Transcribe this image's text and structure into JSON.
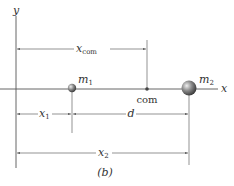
{
  "figure": {
    "caption": "(b)",
    "axes": {
      "x_label": "x",
      "y_label": "y"
    },
    "particles": [
      {
        "name": "m",
        "subscript": "1",
        "label": "m₁",
        "position_label": "x₁",
        "size": "small"
      },
      {
        "name": "m",
        "subscript": "2",
        "label": "m₂",
        "position_label": "x₂",
        "size": "large"
      }
    ],
    "center_of_mass": {
      "point_label": "com",
      "distance_label_main": "x",
      "distance_label_sub": "com"
    },
    "dimensions": {
      "x1_main": "x",
      "x1_sub": "1",
      "d": "d",
      "x2_main": "x",
      "x2_sub": "2"
    },
    "colors": {
      "line": "#555555",
      "guide": "#888888",
      "ball_light": "#e0e0e0",
      "ball_dark": "#3a3a3a"
    }
  }
}
